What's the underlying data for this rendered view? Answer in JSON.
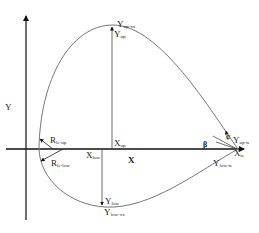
{
  "diagram": {
    "type": "airfoil-parametrization",
    "axes": {
      "x_label": "X",
      "y_label": "Y"
    },
    "labels": {
      "y_up_xx_main": "Y",
      "y_up_xx_sub": "up-xx",
      "y_up_main": "Y",
      "y_up_sub": "up",
      "x_up_main": "X",
      "x_up_sub": "up",
      "x_low_main": "X",
      "x_low_sub": "low",
      "y_low_main": "Y",
      "y_low_sub": "low",
      "y_low_xx_main": "Y",
      "y_low_xx_sub": "low-xx",
      "r_le_up_main": "R",
      "r_le_up_sub": "le-up",
      "r_le_low_main": "R",
      "r_le_low_sub": "le-low",
      "alpha": "α",
      "beta": "β",
      "y_up_te_main": "Y",
      "y_up_te_sub": "up-te",
      "x_te_main": "X",
      "x_te_sub": "te",
      "y_low_te_main": "Y",
      "y_low_te_sub": "low-te"
    },
    "colors": {
      "axis": "#111111",
      "curve": "#777777",
      "text": "#222222"
    }
  }
}
